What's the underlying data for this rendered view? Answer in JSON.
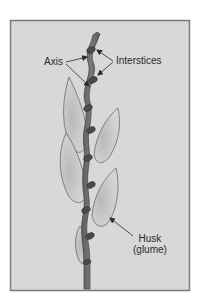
{
  "figure": {
    "title": "",
    "background_color": "#ffffff",
    "frame": {
      "fill": "#d8d8d8",
      "border": "#7a7a7a"
    },
    "stem_color": "#6e6e6e",
    "node_color": "#4a4a4a",
    "glume_fill": "#cfcfcf",
    "glume_outline": "#6a6a6a"
  },
  "labels": {
    "axis": "Axis",
    "interstices": "Interstices",
    "husk_line1": "Husk",
    "husk_line2": "(glume)"
  }
}
